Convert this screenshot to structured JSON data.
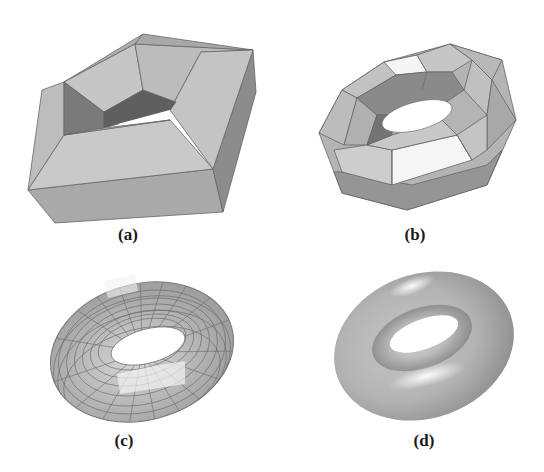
{
  "figure": {
    "panels": [
      {
        "id": "a",
        "label": "(a)",
        "description": "coarse polyhedral control mesh of a torus (quadrilateral ring)"
      },
      {
        "id": "b",
        "label": "(b)",
        "description": "first subdivision level, faceted octagonal torus"
      },
      {
        "id": "c",
        "label": "(c)",
        "description": "further refined quad mesh torus with visible grid lines"
      },
      {
        "id": "d",
        "label": "(d)",
        "description": "smooth shaded limit surface torus"
      }
    ]
  },
  "colors": {
    "background": "#ffffff",
    "face_light": "#c8c8c8",
    "face_mid": "#aaaaaa",
    "face_dark": "#7c7c7c",
    "face_highlight": "#f2f2f2",
    "edge": "#555555",
    "caption": "#1a1a1a"
  }
}
